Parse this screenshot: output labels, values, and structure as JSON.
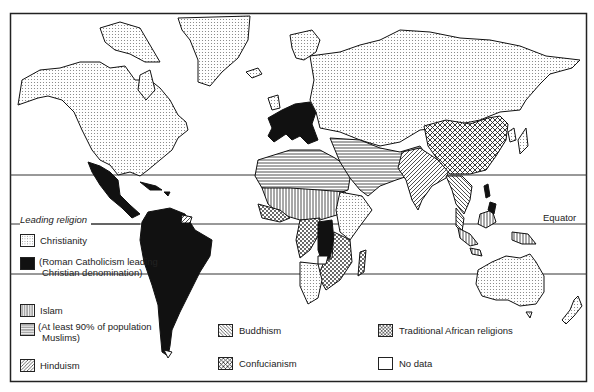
{
  "map": {
    "title": "Leading religion",
    "lines": {
      "equator_label": "Equator"
    }
  },
  "legend": {
    "heading": "Leading religion",
    "items": [
      {
        "key": "christianity",
        "label": "Christianity",
        "pattern": "fine-dots"
      },
      {
        "key": "roman-catholicism",
        "label_line1": "(Roman Catholicism leading",
        "label_line2": "Christian denomination)",
        "pattern": "solid-black"
      },
      {
        "key": "islam",
        "label": "Islam",
        "pattern": "vertical-lines"
      },
      {
        "key": "islam-90",
        "label_line1": "(At least 90% of population",
        "label_line2": "Muslims)",
        "pattern": "horizontal-lines"
      },
      {
        "key": "hinduism",
        "label": "Hinduism",
        "pattern": "diagonal-lines"
      },
      {
        "key": "buddhism",
        "label": "Buddhism",
        "pattern": "back-diagonal-lines"
      },
      {
        "key": "confucianism",
        "label": "Confucianism",
        "pattern": "crosshatch"
      },
      {
        "key": "traditional-african",
        "label": "Traditional African religions",
        "pattern": "coarse-dots"
      },
      {
        "key": "no-data",
        "label": "No data",
        "pattern": "blank"
      }
    ]
  },
  "colors": {
    "ink": "#1a1a1a",
    "paper": "#ffffff",
    "dots": "#9a9a9a"
  }
}
